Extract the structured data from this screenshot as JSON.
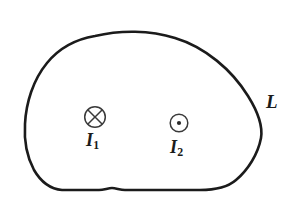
{
  "figure": {
    "kind": "physics-diagram",
    "background_color": "#ffffff",
    "stroke_color": "#1b1b1b",
    "labels": {
      "loop": "L",
      "current_1_symbol": "I",
      "current_1_subscript": "1",
      "current_2_symbol": "I",
      "current_2_subscript": "2"
    },
    "elements": [
      {
        "name": "closed-loop-curve",
        "icon": "closed-curve-loop",
        "label": "L",
        "stroke_width": 2.6
      },
      {
        "name": "current-into-page",
        "icon": "circle-cross-icon",
        "label": "I",
        "subscript": "1",
        "direction": "into page",
        "center_x": 95,
        "center_y": 117,
        "radius": 10.5
      },
      {
        "name": "current-out-of-page",
        "icon": "circle-dot-icon",
        "label": "I",
        "subscript": "2",
        "direction": "out of page",
        "center_x": 179,
        "center_y": 123,
        "radius": 9
      }
    ]
  }
}
